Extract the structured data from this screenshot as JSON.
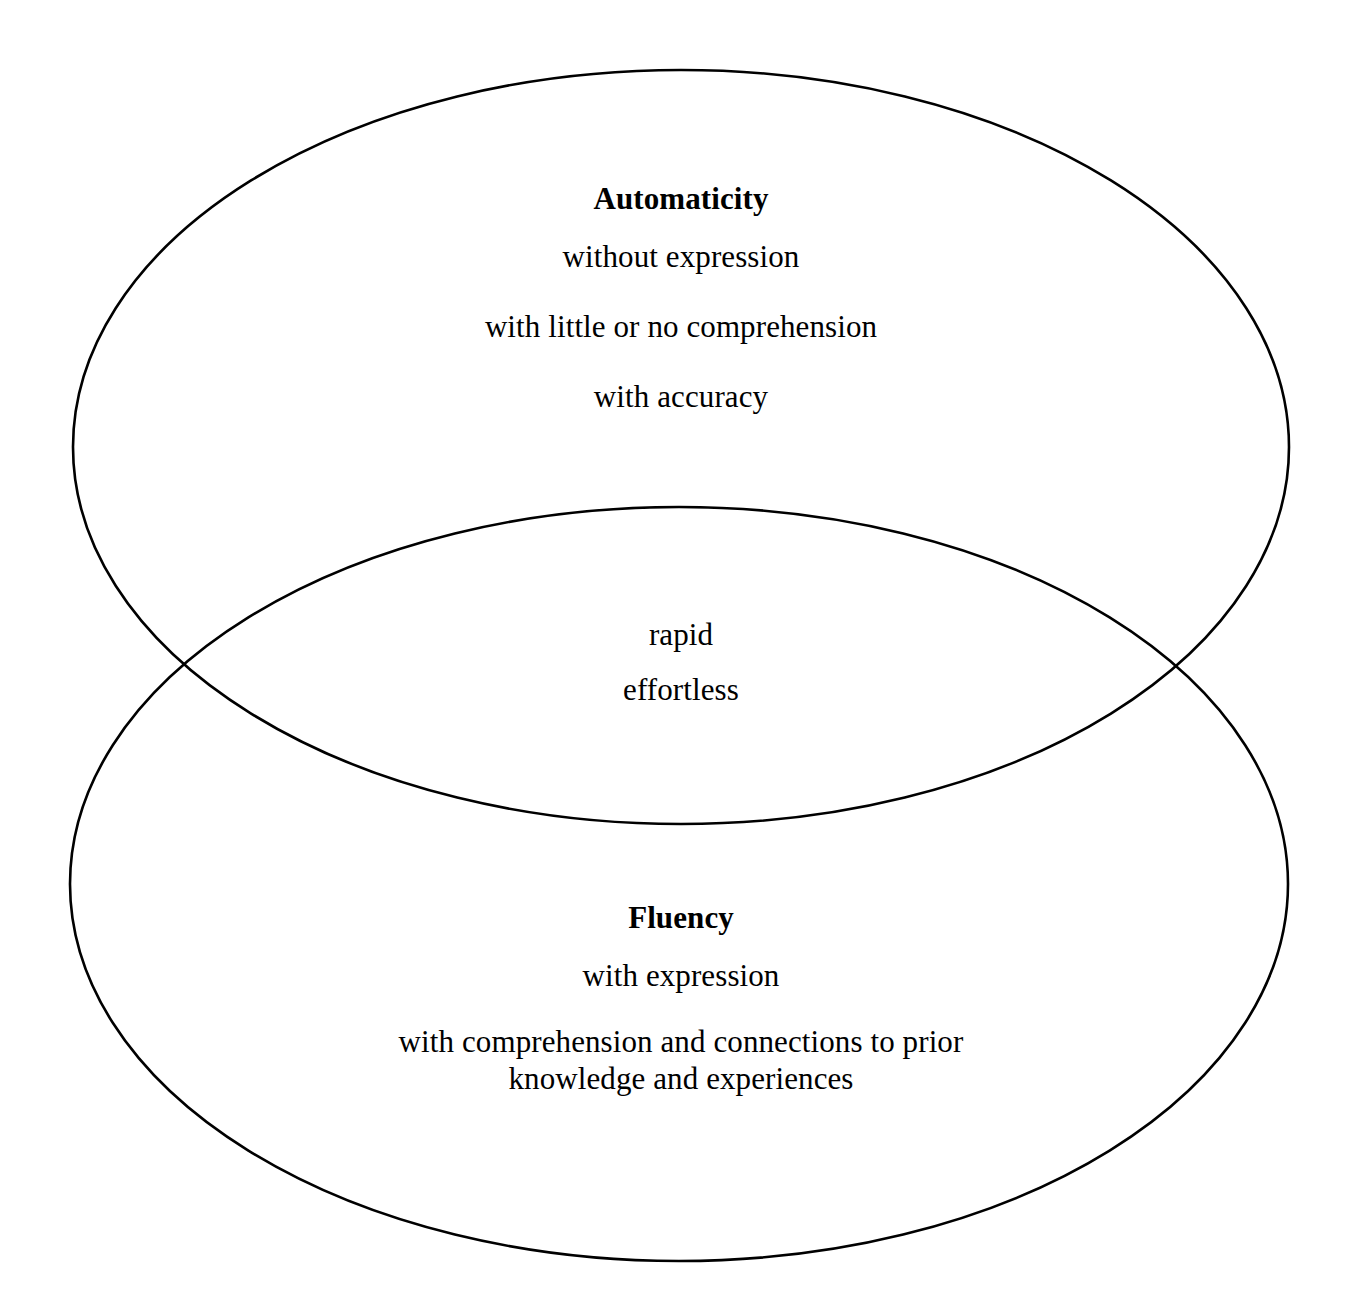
{
  "diagram": {
    "type": "venn-two-set",
    "background_color": "#ffffff",
    "stroke_color": "#000000",
    "text_color": "#000000",
    "sets": [
      {
        "id": "automaticity",
        "title": "Automaticity",
        "position": "top",
        "items": [
          "without expression",
          "with little or no comprehension",
          "with accuracy"
        ]
      },
      {
        "id": "fluency",
        "title": "Fluency",
        "position": "bottom",
        "items": [
          "with expression",
          "with comprehension and connections to prior knowledge and experiences"
        ]
      }
    ],
    "intersection": {
      "id": "shared",
      "items": [
        "rapid",
        "effortless"
      ]
    },
    "text": {
      "automaticity_title": "Automaticity",
      "automaticity_item_1": "without expression",
      "automaticity_item_2": "with little or no comprehension",
      "automaticity_item_3": "with accuracy",
      "shared_item_1": "rapid",
      "shared_item_2": "effortless",
      "fluency_title": "Fluency",
      "fluency_item_1": "with expression",
      "fluency_item_2": "with comprehension and connections to prior knowledge and experiences"
    }
  }
}
